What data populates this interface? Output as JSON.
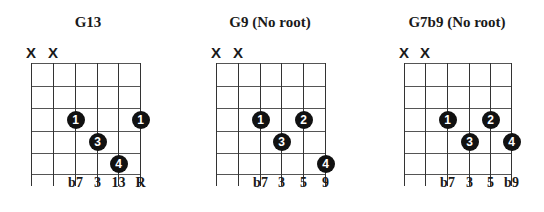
{
  "chords": [
    {
      "name": "G13",
      "left": 0,
      "strings_x": [
        31,
        53,
        75,
        97,
        118,
        140
      ],
      "muted": [
        0,
        1
      ],
      "mute_label": "X",
      "dots": [
        {
          "string": 2,
          "fret": 3,
          "finger": "1"
        },
        {
          "string": 5,
          "fret": 3,
          "finger": "1"
        },
        {
          "string": 3,
          "fret": 4,
          "finger": "3"
        },
        {
          "string": 4,
          "fret": 5,
          "finger": "4"
        }
      ],
      "intervals": [
        {
          "string": 2,
          "label": "b7"
        },
        {
          "string": 3,
          "label": "3"
        },
        {
          "string": 4,
          "label": "13"
        },
        {
          "string": 5,
          "label": "R"
        }
      ]
    },
    {
      "name": "G9 (No root)",
      "left": 0,
      "strings_x": [
        216,
        238,
        260,
        281,
        303,
        325
      ],
      "muted": [
        0,
        1
      ],
      "mute_label": "X",
      "dots": [
        {
          "string": 2,
          "fret": 3,
          "finger": "1"
        },
        {
          "string": 4,
          "fret": 3,
          "finger": "2"
        },
        {
          "string": 3,
          "fret": 4,
          "finger": "3"
        },
        {
          "string": 5,
          "fret": 5,
          "finger": "4"
        }
      ],
      "intervals": [
        {
          "string": 2,
          "label": "b7"
        },
        {
          "string": 3,
          "label": "3"
        },
        {
          "string": 4,
          "label": "5"
        },
        {
          "string": 5,
          "label": "9"
        }
      ]
    },
    {
      "name": "G7b9 (No root)",
      "left": 0,
      "strings_x": [
        404,
        425,
        447,
        469,
        490,
        511
      ],
      "muted": [
        0,
        1
      ],
      "mute_label": "X",
      "dots": [
        {
          "string": 2,
          "fret": 3,
          "finger": "1"
        },
        {
          "string": 4,
          "fret": 3,
          "finger": "2"
        },
        {
          "string": 3,
          "fret": 4,
          "finger": "3"
        },
        {
          "string": 5,
          "fret": 4,
          "finger": "4"
        }
      ],
      "intervals": [
        {
          "string": 2,
          "label": "b7"
        },
        {
          "string": 3,
          "label": "3"
        },
        {
          "string": 4,
          "label": "5"
        },
        {
          "string": 5,
          "label": "b9"
        }
      ]
    }
  ],
  "layout": {
    "fret_y": [
      63,
      86,
      108,
      131,
      153,
      174
    ],
    "string_top": 63,
    "string_bottom": 186,
    "mute_y": 45,
    "title_centers": [
      88,
      270,
      457
    ]
  }
}
